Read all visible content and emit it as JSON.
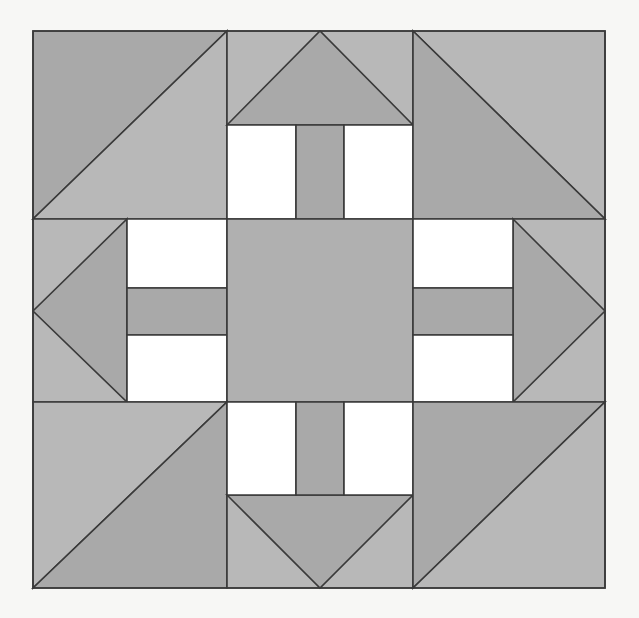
{
  "document": {
    "kind": "quilt-block-diagram",
    "title": "",
    "background_color": "#f7f7f5",
    "canvas": {
      "width": 639,
      "height": 618
    }
  },
  "palette": {
    "background": "#f7f7f5",
    "light_gray": "#b8b8b8",
    "mid_gray": "#b0b0b0",
    "dark_gray": "#a9a9a9",
    "white": "#ffffff",
    "outline": "#3a3a3a",
    "outline_width": 1.6
  },
  "block": {
    "name": "nine-patch-quilt-block",
    "x": 33,
    "y": 31,
    "width": 572,
    "height": 557,
    "columns": [
      {
        "name": "left",
        "x": 33,
        "width": 194
      },
      {
        "name": "center",
        "x": 227,
        "width": 186
      },
      {
        "name": "right",
        "x": 413,
        "width": 192
      }
    ],
    "rows": [
      {
        "name": "top",
        "y": 31,
        "height": 188
      },
      {
        "name": "middle",
        "y": 219,
        "height": 183
      },
      {
        "name": "bottom",
        "y": 402,
        "height": 186
      }
    ]
  },
  "cells": [
    {
      "name": "cell-top-left",
      "role": "half-square-triangle",
      "orientation": "diagonal-bottom-left-to-top-right",
      "fills": [
        "dark_gray",
        "light_gray"
      ]
    },
    {
      "name": "cell-top-center",
      "role": "flying-geese-and-bars",
      "orientation": "triangle-points-up",
      "fills": [
        "dark_gray",
        "light_gray",
        "white"
      ]
    },
    {
      "name": "cell-top-right",
      "role": "half-square-triangle",
      "orientation": "diagonal-top-left-to-bottom-right",
      "fills": [
        "light_gray",
        "dark_gray"
      ]
    },
    {
      "name": "cell-middle-left",
      "role": "flying-geese-and-bars",
      "orientation": "triangle-points-left",
      "fills": [
        "dark_gray",
        "light_gray",
        "white"
      ]
    },
    {
      "name": "cell-middle-center",
      "role": "center-square",
      "orientation": "none",
      "fills": [
        "mid_gray"
      ]
    },
    {
      "name": "cell-middle-right",
      "role": "flying-geese-and-bars",
      "orientation": "triangle-points-right",
      "fills": [
        "dark_gray",
        "light_gray",
        "white"
      ]
    },
    {
      "name": "cell-bottom-left",
      "role": "half-square-triangle",
      "orientation": "diagonal-top-left-to-bottom-right",
      "fills": [
        "light_gray",
        "dark_gray"
      ]
    },
    {
      "name": "cell-bottom-center",
      "role": "flying-geese-and-bars",
      "orientation": "triangle-points-down",
      "fills": [
        "dark_gray",
        "light_gray",
        "white"
      ]
    },
    {
      "name": "cell-bottom-right",
      "role": "half-square-triangle",
      "orientation": "diagonal-bottom-left-to-top-right",
      "fills": [
        "dark_gray",
        "light_gray"
      ]
    }
  ],
  "geometry": {
    "block_outline": "M33,31 L605,31 L605,588 L33,588 Z",
    "top_left_hst_upper": "M33,31 L227,31 L33,219 Z",
    "top_left_hst_lower": "M227,31 L227,219 L33,219 Z",
    "top_right_hst_upper": "M413,31 L605,31 L605,219 Z",
    "top_right_hst_lower": "M413,31 L605,219 L413,219 Z",
    "bottom_left_hst_upper": "M33,402 L227,402 L33,588 Z",
    "bottom_left_hst_lower": "M227,402 L227,588 L33,588 Z",
    "bottom_right_hst_upper": "M413,402 L605,402 L413,588 Z",
    "bottom_right_hst_lower": "M605,402 L605,588 L413,588 Z",
    "top_goose_triangle": "M227,125 L320,31 L413,125 Z",
    "top_goose_band": "M227,31 L413,31 L413,125 L227,125 Z",
    "top_bar_left_white": "M227,125 L296,125 L296,219 L227,219 Z",
    "top_bar_center_gray": "M296,125 L344,125 L344,219 L296,219 Z",
    "top_bar_right_white": "M344,125 L413,125 L413,219 L344,219 Z",
    "bottom_goose_triangle": "M227,495 L320,588 L413,495 Z",
    "bottom_goose_band": "M227,495 L413,495 L413,588 L227,588 Z",
    "bottom_bar_left_white": "M227,402 L296,402 L296,495 L227,495 Z",
    "bottom_bar_center_gray": "M296,402 L344,402 L344,495 L296,495 Z",
    "bottom_bar_right_white": "M344,402 L413,402 L413,495 L344,495 Z",
    "left_goose_triangle": "M127,219 L127,402 L33,311 Z",
    "left_goose_band": "M33,219 L127,219 L127,402 L33,402 Z",
    "left_bar_top_white": "M127,219 L227,219 L227,288 L127,288 Z",
    "left_bar_mid_gray": "M127,288 L227,288 L227,335 L127,335 Z",
    "left_bar_bottom_white": "M127,335 L227,335 L227,402 L127,402 Z",
    "right_goose_triangle": "M513,219 L605,311 L513,402 Z",
    "right_goose_band": "M513,219 L605,219 L605,402 L513,402 Z",
    "right_bar_top_white": "M413,219 L513,219 L513,288 L413,288 Z",
    "right_bar_mid_gray": "M413,288 L513,288 L513,335 L413,335 Z",
    "right_bar_bottom_white": "M413,335 L513,335 L513,402 L413,402 Z",
    "center_square": "M227,219 L413,219 L413,402 L227,402 Z"
  },
  "chart_data": {
    "type": "diagram",
    "grid": {
      "rows": 3,
      "columns": 3
    },
    "fabric_counts": {
      "half_square_triangle_units": 4,
      "flying_geese_units": 4,
      "center_squares": 1,
      "white_rectangles": 8,
      "gray_bars": 4
    },
    "colors_used": [
      "#b8b8b8",
      "#b0b0b0",
      "#a9a9a9",
      "#ffffff"
    ]
  }
}
